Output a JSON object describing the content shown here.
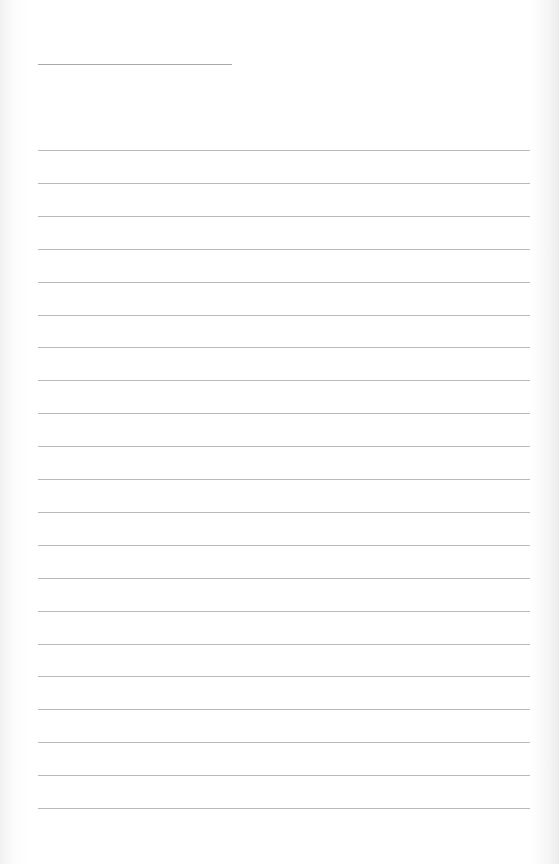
{
  "page": {
    "background": "#ffffff",
    "line_color": "#a8a8a8",
    "title_line": {
      "x1": 38,
      "x2": 232,
      "y": 64
    },
    "ruled_lines": {
      "count": 21,
      "x1": 38,
      "x2": 530,
      "first_y": 150,
      "spacing": 32.9
    },
    "title_text": "",
    "body_text": []
  }
}
